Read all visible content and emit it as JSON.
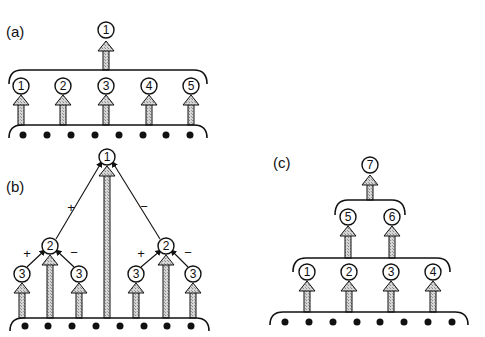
{
  "panels": {
    "a": {
      "label": "(a)",
      "top_node": "1",
      "level1_nodes": [
        "1",
        "2",
        "3",
        "4",
        "5"
      ],
      "input_dots": 8
    },
    "b": {
      "label": "(b)",
      "root": "1",
      "left_mid": "2",
      "right_mid": "2",
      "leaves": [
        "3",
        "3",
        "3",
        "3"
      ],
      "root_signs": {
        "left": "+",
        "right": "−"
      },
      "left_signs": {
        "left": "+",
        "right": "−"
      },
      "right_signs": {
        "left": "+",
        "right": "−"
      },
      "input_dots": 8
    },
    "c": {
      "label": "(c)",
      "top_node": "7",
      "level2_nodes": [
        "5",
        "6"
      ],
      "level1_nodes": [
        "1",
        "2",
        "3",
        "4"
      ],
      "input_dots": 8
    }
  },
  "colors": {
    "stroke": "#111111",
    "arrow_fill": "#bdbdbd",
    "background": "#ffffff"
  }
}
